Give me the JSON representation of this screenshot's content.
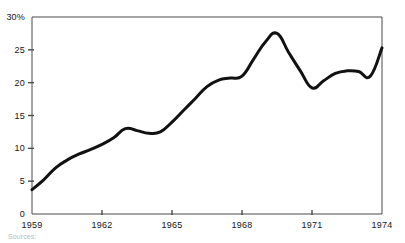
{
  "figure": {
    "background_color": "#ffffff",
    "line_color": "#111111",
    "axis_color": "#4a4a4a",
    "source_note": "Sources:"
  },
  "axes": {
    "y_tick_labels": [
      "30%",
      "25",
      "20",
      "15",
      "10",
      "5",
      "0"
    ],
    "x_tick_labels": [
      "1959",
      "1962",
      "1965",
      "1968",
      "1971",
      "1974"
    ]
  },
  "chart_data": {
    "type": "line",
    "title": "",
    "subtitle": "",
    "xlabel": "",
    "ylabel": "",
    "xlim": [
      1959,
      1974
    ],
    "ylim": [
      0,
      30
    ],
    "grid": false,
    "legend": null,
    "y_unit": "%",
    "x_ticks": [
      1959,
      1962,
      1965,
      1968,
      1971,
      1974
    ],
    "y_ticks": [
      0,
      5,
      10,
      15,
      20,
      25,
      30
    ],
    "series": [
      {
        "name": "percent",
        "x": [
          1959,
          1959.5,
          1960,
          1960.5,
          1961,
          1961.5,
          1962,
          1962.5,
          1963,
          1963.5,
          1964,
          1964.5,
          1965,
          1965.5,
          1966,
          1966.5,
          1967,
          1967.5,
          1968,
          1968.5,
          1969,
          1969.5,
          1970,
          1970.5,
          1971,
          1971.5,
          1972,
          1972.5,
          1973,
          1973.5,
          1974
        ],
        "values": [
          3.7,
          5.2,
          7.0,
          8.2,
          9.1,
          9.8,
          10.6,
          11.6,
          13.0,
          12.7,
          12.3,
          12.5,
          14.0,
          15.8,
          17.6,
          19.4,
          20.4,
          20.7,
          21.0,
          23.6,
          26.2,
          27.5,
          24.6,
          21.8,
          19.2,
          20.3,
          21.4,
          21.8,
          21.7,
          21.0,
          25.3
        ]
      }
    ]
  },
  "plot_geometry": {
    "left": 32,
    "right": 382,
    "top": 17,
    "bottom": 214
  }
}
